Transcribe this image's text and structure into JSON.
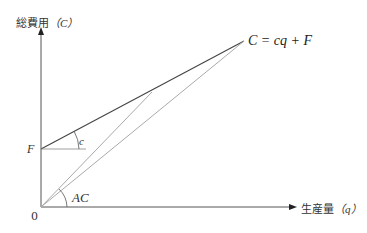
{
  "diagram": {
    "y_axis_label": "総費用（C）",
    "y_axis_label_main": "総費用",
    "y_axis_label_var": "（C）",
    "x_axis_label_main": "生産量",
    "x_axis_label_var": "（q）",
    "origin_label": "0",
    "intercept_label": "F",
    "equation_label": "C = cq + F",
    "slope_angle_label": "c",
    "average_cost_angle_label": "AC",
    "colors": {
      "axis": "#555555",
      "total_cost_line": "#444444",
      "ray_lines": "#aaaaaa",
      "guide_line": "#888888"
    }
  }
}
